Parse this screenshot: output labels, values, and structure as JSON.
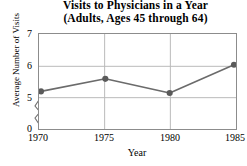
{
  "chart_data": {
    "type": "line",
    "title": "Visits to Physicians in a Year",
    "subtitle": "(Adults, Ages 45 through 64)",
    "xlabel": "Year",
    "ylabel": "Average Number of Visits",
    "categories": [
      "1970",
      "1975",
      "1980",
      "1985"
    ],
    "x": [
      1970,
      1975,
      1980,
      1985
    ],
    "values": [
      5.2,
      5.6,
      5.15,
      6.05
    ],
    "series": [
      {
        "name": "Average Number of Visits",
        "values": [
          5.2,
          5.6,
          5.15,
          6.05
        ]
      }
    ],
    "xlim": [
      1970,
      1985
    ],
    "ylim": [
      5,
      7
    ],
    "ytick_labels": [
      "7",
      "6",
      "5",
      "0"
    ],
    "ytick_values": [
      7,
      6,
      5,
      0
    ],
    "xtick_labels": [
      "1970",
      "1975",
      "1980",
      "1985"
    ],
    "grid": true,
    "axis_break": true,
    "axis_break_note": "y-axis broken between 0 and 5",
    "legend": "none",
    "marker": "filled-circle",
    "line_color": "#6b6b6b",
    "marker_color": "#5a5a5a",
    "grid_color": "#b9b9b9",
    "frame_color": "#8c8c8c"
  },
  "ticks": {
    "y": [
      {
        "label": "7"
      },
      {
        "label": "6"
      },
      {
        "label": "5"
      },
      {
        "label": "0"
      }
    ],
    "x": [
      {
        "label": "1970"
      },
      {
        "label": "1975"
      },
      {
        "label": "1980"
      },
      {
        "label": "1985"
      }
    ]
  }
}
